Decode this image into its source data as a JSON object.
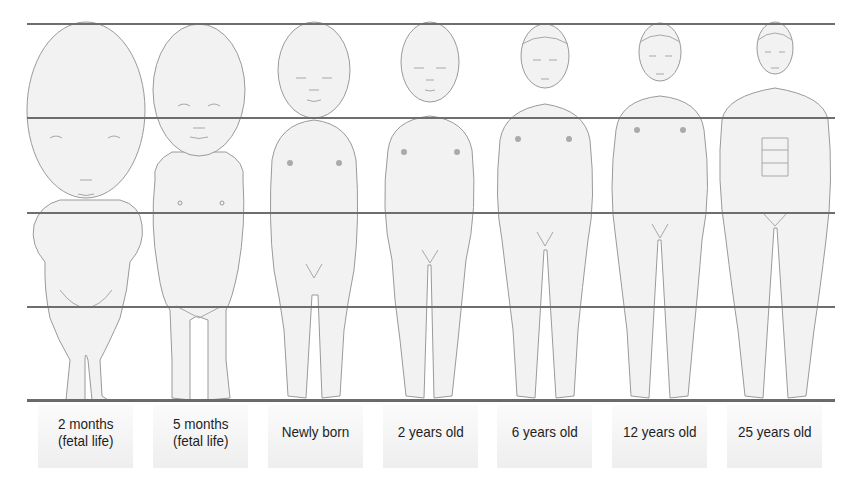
{
  "diagram": {
    "guide_lines": {
      "count": 4,
      "y_positions": [
        24,
        118,
        213,
        307
      ],
      "baseline_y": 400,
      "color": "#6e6e6e"
    },
    "figures": [
      {
        "id": "fetal-2-months",
        "label": "2 months\n(fetal life)",
        "head_fraction": "1/2"
      },
      {
        "id": "fetal-5-months",
        "label": "5 months\n(fetal life)",
        "head_fraction": "1/3"
      },
      {
        "id": "newborn",
        "label": "Newly born",
        "head_fraction": "1/4"
      },
      {
        "id": "age-2",
        "label": "2 years old",
        "head_fraction": "1/5"
      },
      {
        "id": "age-6",
        "label": "6 years old",
        "head_fraction": "1/6"
      },
      {
        "id": "age-12",
        "label": "12 years old",
        "head_fraction": "1/7"
      },
      {
        "id": "age-25",
        "label": "25 years old",
        "head_fraction": "1/8"
      }
    ],
    "colors": {
      "figure_fill": "#f2f2f2",
      "figure_stroke": "#9a9a9a",
      "label_bg": "#f0f0f0",
      "label_text": "#1e1e1e"
    }
  }
}
